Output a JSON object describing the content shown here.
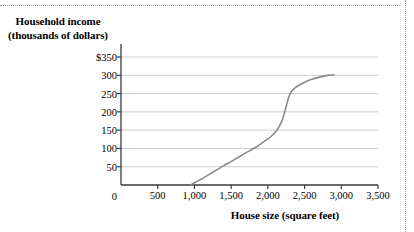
{
  "chart_data": {
    "type": "line",
    "title": "",
    "xlabel": "House size (square feet)",
    "ylabel": "Household income (thousands of dollars)",
    "ylabel_line1": "Household income",
    "ylabel_line2": "(thousands of dollars)",
    "xlim": [
      0,
      3500
    ],
    "ylim": [
      0,
      350
    ],
    "xticks": [
      0,
      500,
      1000,
      1500,
      2000,
      2500,
      3000,
      3500
    ],
    "xtick_labels": [
      "0",
      "500",
      "1,000",
      "1,500",
      "2,000",
      "2,500",
      "3,000",
      "3,500"
    ],
    "yticks": [
      0,
      50,
      100,
      150,
      200,
      250,
      300,
      350
    ],
    "ytick_labels": [
      "0",
      "50",
      "100",
      "150",
      "200",
      "250",
      "300",
      "$350"
    ],
    "grid": "horizontal",
    "legend": "none",
    "series": [
      {
        "name": "household income vs house size",
        "color": "#8a8a8a",
        "points": [
          [
            950,
            0
          ],
          [
            1000,
            6
          ],
          [
            1100,
            17
          ],
          [
            1200,
            29
          ],
          [
            1300,
            41
          ],
          [
            1400,
            53
          ],
          [
            1500,
            64
          ],
          [
            1600,
            76
          ],
          [
            1700,
            88
          ],
          [
            1800,
            99
          ],
          [
            1900,
            112
          ],
          [
            2000,
            126
          ],
          [
            2050,
            134
          ],
          [
            2100,
            144
          ],
          [
            2150,
            158
          ],
          [
            2200,
            180
          ],
          [
            2250,
            215
          ],
          [
            2280,
            238
          ],
          [
            2310,
            252
          ],
          [
            2350,
            262
          ],
          [
            2400,
            270
          ],
          [
            2500,
            281
          ],
          [
            2600,
            289
          ],
          [
            2700,
            295
          ],
          [
            2800,
            299
          ],
          [
            2900,
            301
          ]
        ]
      }
    ]
  },
  "axis_colors": {
    "axis_line": "#3a3a3a",
    "gridline": "#cfcfcf",
    "curve": "#8a8a8a",
    "border_dots": "#9a9a9a"
  }
}
